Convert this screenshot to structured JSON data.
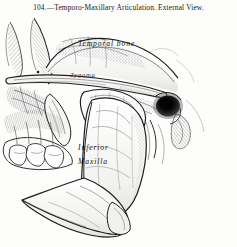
{
  "plate": {
    "caption": "104.—Temporo-Maxillary Articulation.   External View.",
    "figure_number": "104",
    "title": "Temporo-Maxillary Articulation",
    "view": "External View",
    "medium": "engraving",
    "ink_color": "#1a1a1a",
    "paper_color": "#fdfdfc"
  },
  "labels": {
    "temporal_bone": "Temporal   bone",
    "zygoma": "Zygoma",
    "inferior": "Inferior",
    "maxilla": "Maxilla"
  },
  "structures": [
    {
      "name": "cranium-cut-edge",
      "label": ""
    },
    {
      "name": "temporal-fossa",
      "label": ""
    },
    {
      "name": "zygomatic-arch",
      "label": ""
    },
    {
      "name": "external-auditory-meatus",
      "label": ""
    },
    {
      "name": "mastoid-process",
      "label": ""
    },
    {
      "name": "capsular-ligament",
      "label": ""
    },
    {
      "name": "coronoid-process",
      "label": ""
    },
    {
      "name": "mandibular-ramus",
      "label": ""
    },
    {
      "name": "mandibular-angle",
      "label": ""
    },
    {
      "name": "mandibular-body",
      "label": ""
    },
    {
      "name": "molar-teeth",
      "label": ""
    },
    {
      "name": "styloid-process",
      "label": ""
    }
  ]
}
